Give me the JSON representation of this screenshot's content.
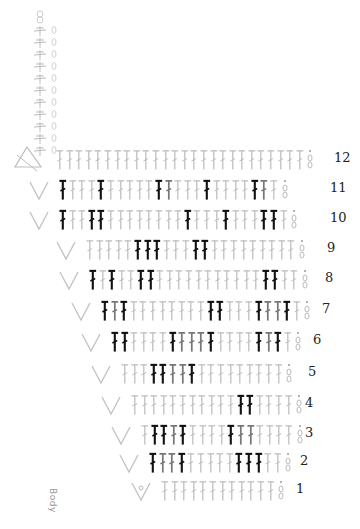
{
  "diagram": {
    "type": "crochet-stitch-chart",
    "label": "Body",
    "colors": {
      "dark": "#111111",
      "medium": "#777777",
      "light": "#bdbdbd",
      "number": "#222222"
    },
    "vertical_chain": {
      "stitch_count": 11,
      "symbol": "hdc-column-with-chain"
    },
    "rows": [
      {
        "n": "12",
        "top": 147,
        "left": 55,
        "num_left": 334,
        "start": "triangle",
        "pattern": "gggggggggggggggggggggggggg"
      },
      {
        "n": "11",
        "top": 177,
        "left": 28,
        "num_left": 330,
        "start": "v",
        "pattern": "dgggdgggggdmgggdggggdmg"
      },
      {
        "n": "10",
        "top": 207,
        "left": 28,
        "num_left": 330,
        "start": "v",
        "pattern": "dggddggggggggdgggdgggddg"
      },
      {
        "n": "9",
        "top": 237,
        "left": 55,
        "num_left": 327,
        "start": "v",
        "pattern": "gggggdddgggddggggggggg"
      },
      {
        "n": "8",
        "top": 267,
        "left": 58,
        "num_left": 325,
        "start": "v",
        "pattern": "dgdggddgggggggggggddgg"
      },
      {
        "n": "7",
        "top": 298,
        "left": 70,
        "num_left": 322,
        "start": "v",
        "pattern": "dmdggggggggddgggdmmdg"
      },
      {
        "n": "6",
        "top": 329,
        "left": 80,
        "num_left": 313,
        "start": "v",
        "pattern": "ddggggdmmmdggggdmdg"
      },
      {
        "n": "5",
        "top": 361,
        "left": 90,
        "num_left": 308,
        "start": "v",
        "pattern": "gggddmmdggggggggg"
      },
      {
        "n": "4",
        "top": 392,
        "left": 100,
        "num_left": 305,
        "start": "v",
        "pattern": "gggggggggggddgggg"
      },
      {
        "n": "3",
        "top": 422,
        "left": 110,
        "num_left": 305,
        "start": "v",
        "pattern": "gddmdggggdmmgggg"
      },
      {
        "n": "2",
        "top": 450,
        "left": 118,
        "num_left": 300,
        "start": "v",
        "pattern": "dmmdgggggdddgg"
      },
      {
        "n": "1",
        "top": 478,
        "left": 130,
        "num_left": 296,
        "start": "v-dot",
        "pattern": "gggggggggggg"
      }
    ]
  }
}
